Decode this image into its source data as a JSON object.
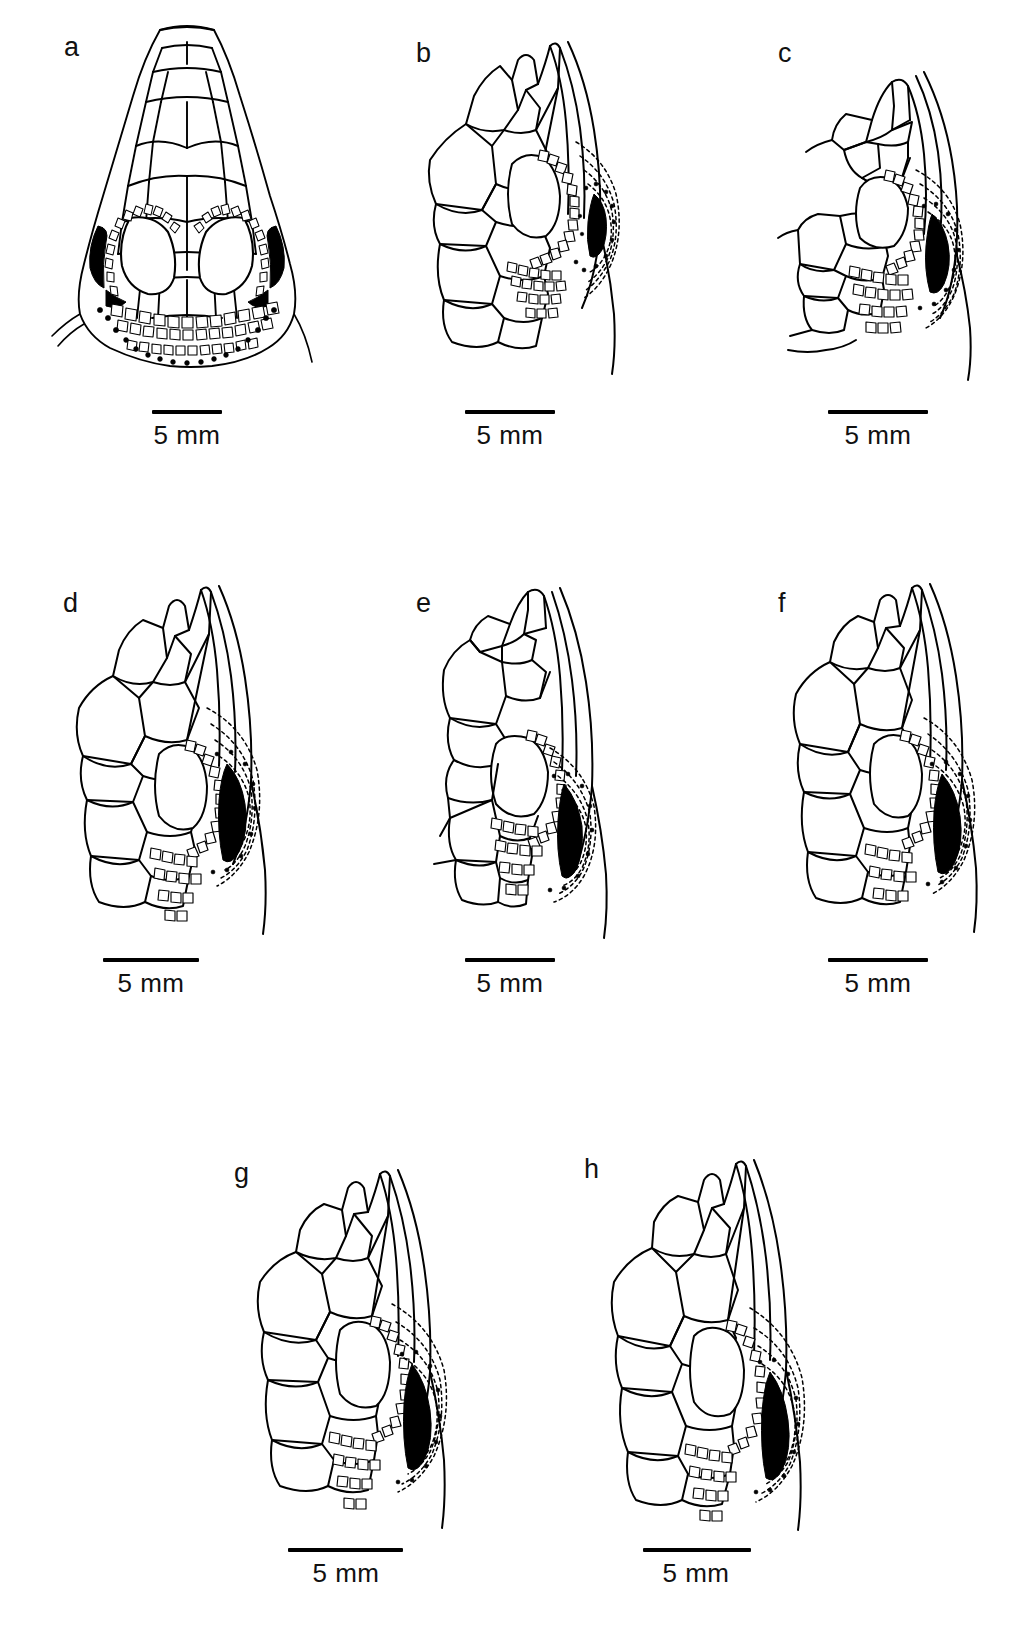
{
  "figure": {
    "kind": "scientific-line-drawing-plate",
    "background_color": "#ffffff",
    "ink_color": "#000000",
    "panel_count": 8,
    "rows": 3
  },
  "panels": [
    {
      "id": "a",
      "label": "a",
      "view": "dorsal view of head",
      "row": 1,
      "column": 1,
      "scalebar": {
        "label": "5 mm",
        "length_px": 70,
        "value": 5,
        "unit": "mm"
      }
    },
    {
      "id": "b",
      "label": "b",
      "view": "lateral view of temporal region",
      "row": 1,
      "column": 2,
      "scalebar": {
        "label": "5 mm",
        "length_px": 90,
        "value": 5,
        "unit": "mm"
      }
    },
    {
      "id": "c",
      "label": "c",
      "view": "lateral view of temporal region",
      "row": 1,
      "column": 3,
      "scalebar": {
        "label": "5 mm",
        "length_px": 100,
        "value": 5,
        "unit": "mm"
      }
    },
    {
      "id": "d",
      "label": "d",
      "view": "lateral view of temporal region",
      "row": 2,
      "column": 1,
      "scalebar": {
        "label": "5 mm",
        "length_px": 96,
        "value": 5,
        "unit": "mm"
      }
    },
    {
      "id": "e",
      "label": "e",
      "view": "lateral view of temporal region",
      "row": 2,
      "column": 2,
      "scalebar": {
        "label": "5 mm",
        "length_px": 90,
        "value": 5,
        "unit": "mm"
      }
    },
    {
      "id": "f",
      "label": "f",
      "view": "lateral view of temporal region",
      "row": 2,
      "column": 3,
      "scalebar": {
        "label": "5 mm",
        "length_px": 100,
        "value": 5,
        "unit": "mm"
      }
    },
    {
      "id": "g",
      "label": "g",
      "view": "lateral view of temporal region",
      "row": 3,
      "column": 1,
      "scalebar": {
        "label": "5 mm",
        "length_px": 115,
        "value": 5,
        "unit": "mm"
      }
    },
    {
      "id": "h",
      "label": "h",
      "view": "lateral view of temporal region",
      "row": 3,
      "column": 2,
      "scalebar": {
        "label": "5 mm",
        "length_px": 108,
        "value": 5,
        "unit": "mm"
      }
    }
  ]
}
